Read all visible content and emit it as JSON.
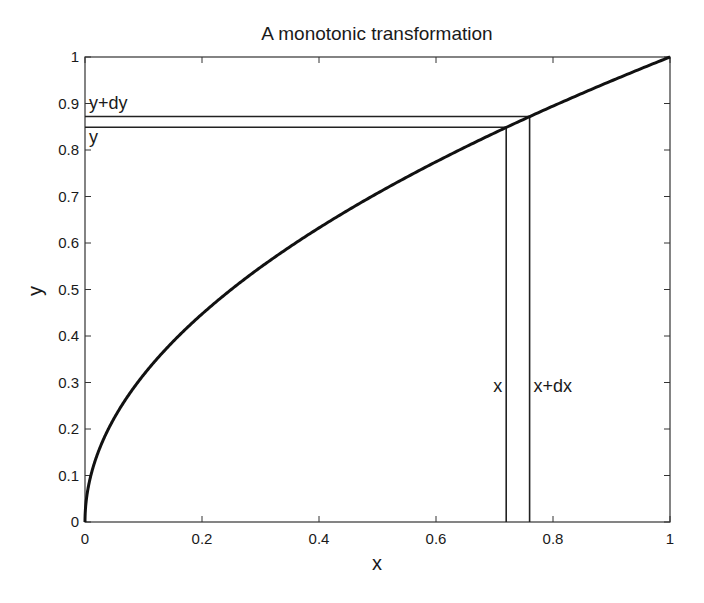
{
  "chart_data": {
    "type": "line",
    "title": "A monotonic transformation",
    "xlabel": "x",
    "ylabel": "y",
    "xlim": [
      0,
      1
    ],
    "ylim": [
      0,
      1
    ],
    "xticks": [
      0,
      0.2,
      0.4,
      0.6,
      0.8,
      1
    ],
    "xtick_labels": [
      "0",
      "0.2",
      "0.4",
      "0.6",
      "0.8",
      "1"
    ],
    "yticks": [
      0,
      0.1,
      0.2,
      0.3,
      0.4,
      0.5,
      0.6,
      0.7,
      0.8,
      0.9,
      1
    ],
    "ytick_labels": [
      "0",
      "0.1",
      "0.2",
      "0.3",
      "0.4",
      "0.5",
      "0.6",
      "0.7",
      "0.8",
      "0.9",
      "1"
    ],
    "grid": false,
    "series": [
      {
        "name": "y = sqrt(x)",
        "function": "sqrt",
        "x": [
          0,
          0.01,
          0.02,
          0.05,
          0.1,
          0.15,
          0.2,
          0.3,
          0.4,
          0.5,
          0.6,
          0.7,
          0.8,
          0.9,
          1.0
        ],
        "y": [
          0,
          0.1,
          0.141,
          0.224,
          0.316,
          0.387,
          0.447,
          0.548,
          0.632,
          0.707,
          0.775,
          0.837,
          0.894,
          0.949,
          1.0
        ]
      }
    ],
    "guides": {
      "x": 0.72,
      "x_plus_dx": 0.76,
      "y": 0.849,
      "y_plus_dy": 0.872
    },
    "annotations": [
      {
        "text": "x",
        "anchor": "x",
        "position": "left-of-line"
      },
      {
        "text": "x+dx",
        "anchor": "x_plus_dx",
        "position": "right-of-line"
      },
      {
        "text": "y",
        "anchor": "y",
        "position": "below-line"
      },
      {
        "text": "y+dy",
        "anchor": "y_plus_dy",
        "position": "above-line"
      }
    ]
  }
}
